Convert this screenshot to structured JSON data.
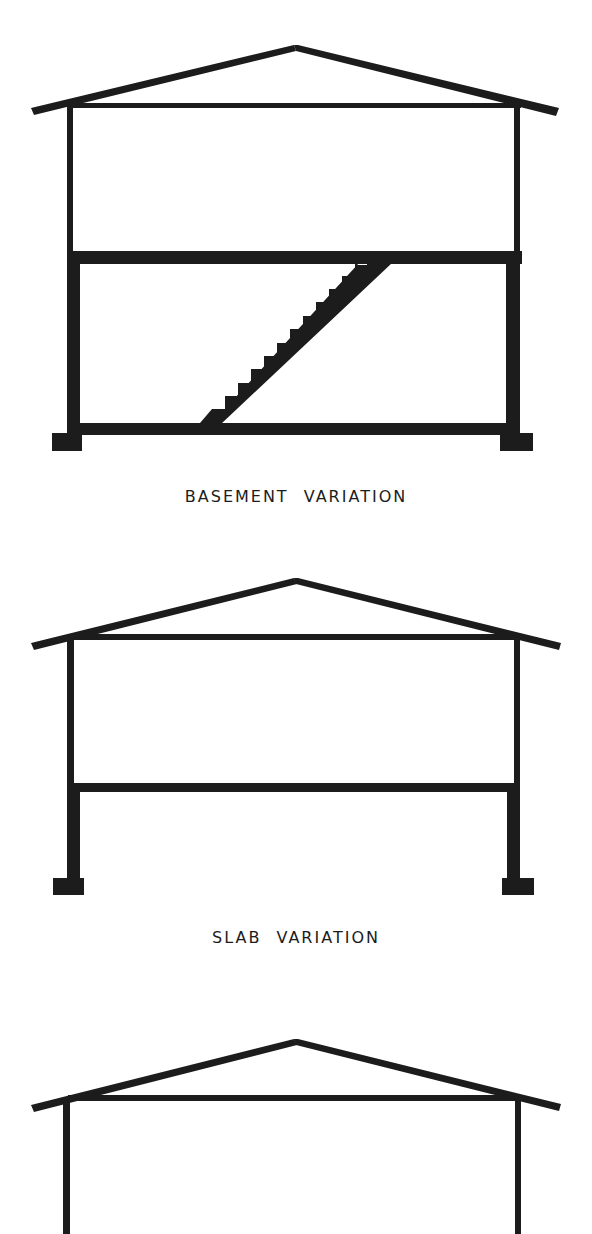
{
  "diagram": {
    "type": "architectural-cross-section-series",
    "ink_color": "#1c1c1c",
    "background": "#ffffff",
    "sections": [
      {
        "id": "basement",
        "caption": "BASEMENT VARIATION",
        "features": [
          "gable-roof",
          "ceiling-joist",
          "upper-floor-walls",
          "thick-floor-slab",
          "basement-walls",
          "basement-floor-slab",
          "stair",
          "footings"
        ],
        "stair_steps": 13
      },
      {
        "id": "slab",
        "caption": "SLAB VARIATION",
        "features": [
          "gable-roof",
          "ceiling-joist",
          "upper-floor-walls",
          "floor-slab",
          "foundation-walls",
          "footings"
        ]
      },
      {
        "id": "third",
        "caption": "",
        "features": [
          "gable-roof",
          "ceiling-joist",
          "walls"
        ],
        "note": "cropped at bottom edge"
      }
    ]
  }
}
